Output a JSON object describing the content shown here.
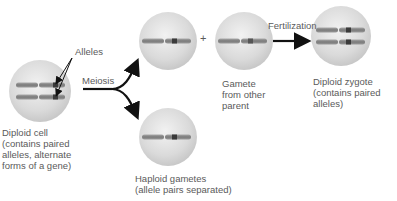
{
  "diagram": {
    "cells": [
      {
        "id": "diploid-cell",
        "caption_lines": [
          "Diploid cell",
          "(contains paired",
          "alleles, alternate",
          "forms of a gene)"
        ]
      },
      {
        "id": "gamete-top",
        "caption_lines": []
      },
      {
        "id": "gamete-other-parent",
        "caption_lines": [
          "Gamete",
          "from other",
          "parent"
        ]
      },
      {
        "id": "diploid-zygote",
        "caption_lines": [
          "Diploid zygote",
          "(contains paired",
          "alleles)"
        ]
      },
      {
        "id": "haploid-gametes",
        "caption_lines": [
          "Haploid gametes",
          "(allele pairs separated)"
        ]
      }
    ],
    "labels": {
      "alleles": "Alleles",
      "meiosis": "Meiosis",
      "plus": "+",
      "fertilization": "Fertilization"
    },
    "colors": {
      "cell_fill": "#dcdcdc",
      "cell_edge": "#c4c4c4",
      "chromosome": "#8a8a8a",
      "allele_band": "#3a3a3a",
      "arrow": "#111111",
      "text": "#5a5a5a"
    }
  }
}
